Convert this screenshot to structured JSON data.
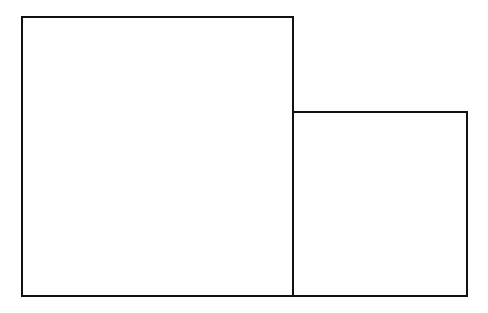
{
  "diagram": {
    "shapes": [
      {
        "id": "large-square",
        "type": "rectangle",
        "x": 21,
        "y": 16,
        "width": 273,
        "height": 281
      },
      {
        "id": "small-rectangle",
        "type": "rectangle",
        "x": 292,
        "y": 111,
        "width": 176,
        "height": 186
      }
    ],
    "stroke_color": "#111111",
    "background_color": "#ffffff"
  }
}
